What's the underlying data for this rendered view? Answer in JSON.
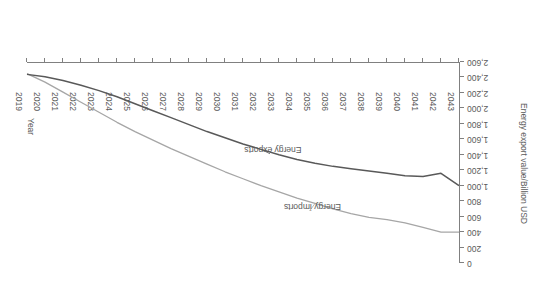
{
  "chart_data": {
    "type": "line",
    "title": "",
    "subtitle": "",
    "xlabel": "Year",
    "ylabel": "Energy export value/Billion USD",
    "grid": false,
    "legend_position": "inline-annotation",
    "rotation_degrees": 180,
    "x_axis_direction": "descending-left-to-right",
    "xlim": [
      2019,
      2043
    ],
    "ylim": [
      0,
      2600
    ],
    "ytick_step": 200,
    "x": [
      2019,
      2020,
      2021,
      2022,
      2023,
      2024,
      2025,
      2026,
      2027,
      2028,
      2029,
      2030,
      2031,
      2032,
      2033,
      2034,
      2035,
      2036,
      2037,
      2038,
      2039,
      2040,
      2041,
      2042,
      2043
    ],
    "xtick_labels": [
      "2043",
      "2042",
      "2041",
      "2040",
      "2039",
      "2038",
      "2037",
      "2036",
      "2035",
      "2034",
      "2033",
      "2032",
      "2031",
      "2030",
      "2029",
      "2028",
      "2027",
      "2026",
      "2025",
      "2024",
      "2023",
      "2022",
      "2021",
      "2020",
      "2019"
    ],
    "ytick_labels": [
      "0",
      "200",
      "400",
      "600",
      "800",
      "1,000",
      "1,200",
      "1,400",
      "1,600",
      "1,800",
      "2,000",
      "2,200",
      "2,400",
      "2,600"
    ],
    "ytick_values": [
      0,
      200,
      400,
      600,
      800,
      1000,
      1200,
      1400,
      1600,
      1800,
      2000,
      2200,
      2400,
      2600
    ],
    "series": [
      {
        "name": "Energy imports",
        "color": "#a6a6a6",
        "label_x": 2027.3,
        "label_y": 660,
        "values": [
          400,
          400,
          460,
          520,
          560,
          590,
          640,
          700,
          770,
          840,
          920,
          1000,
          1090,
          1180,
          1280,
          1380,
          1480,
          1590,
          1700,
          1820,
          1950,
          2080,
          2210,
          2340,
          2450
        ]
      },
      {
        "name": "Energy exports",
        "color": "#595959",
        "label_x": 2029.5,
        "label_y": 1400,
        "values": [
          1000,
          1160,
          1120,
          1130,
          1160,
          1190,
          1220,
          1250,
          1290,
          1340,
          1400,
          1470,
          1540,
          1620,
          1700,
          1790,
          1880,
          1970,
          2060,
          2150,
          2230,
          2300,
          2360,
          2410,
          2440
        ]
      }
    ]
  },
  "axis": {
    "x_title": "Year",
    "y_title": "Energy export value/Billion USD"
  }
}
